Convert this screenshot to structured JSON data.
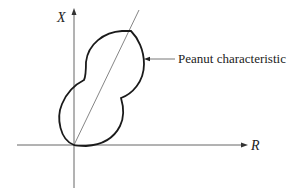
{
  "diagram": {
    "axes": {
      "horizontal_label": "R",
      "vertical_label": "X"
    },
    "annotation": {
      "text": "Peanut characteristic"
    },
    "elements": [
      "vertical axis with arrow (X)",
      "horizontal axis with arrow (R)",
      "diagonal line through origin",
      "peanut-shaped closed curve through origin",
      "leader arrow pointing to curve with label"
    ],
    "colors": {
      "curve": "#1a1a1a",
      "axes": "#555555",
      "diagonal": "#666666",
      "text": "#222222",
      "background": "#ffffff"
    }
  }
}
